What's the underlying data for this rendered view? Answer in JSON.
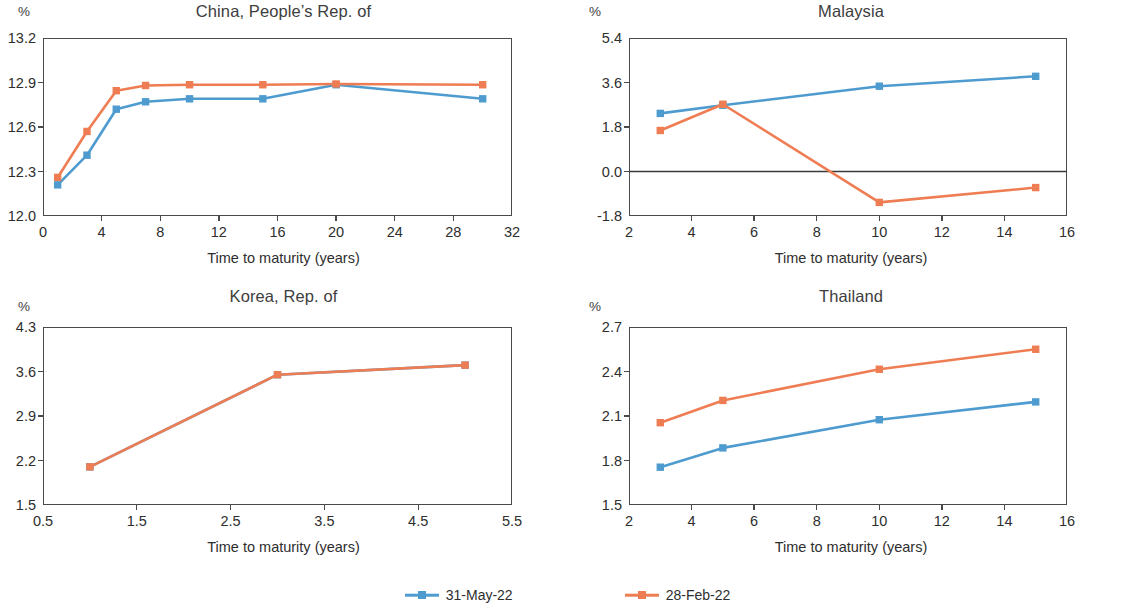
{
  "figure": {
    "axis_label": "Time to maturity  (years)",
    "percent_unit": "%"
  },
  "legend": {
    "position": "bottom-center",
    "items": [
      {
        "label": "31-May-22",
        "color": "#4E9BD0",
        "marker": "square"
      },
      {
        "label": "28-Feb-22",
        "color": "#EF7D53",
        "marker": "square"
      }
    ]
  },
  "chart_data": [
    {
      "type": "line",
      "title": "China, People’s Rep. of",
      "xlabel": "Time to maturity  (years)",
      "ylabel": "%",
      "xlim": [
        0,
        32
      ],
      "ylim": [
        12.0,
        13.2
      ],
      "xticks": [
        0,
        4,
        8,
        12,
        16,
        20,
        24,
        28,
        32
      ],
      "xticklabels": [
        "0",
        "4",
        "8",
        "12",
        "16",
        "20",
        "24",
        "28",
        "32"
      ],
      "yticks": [
        12.0,
        12.3,
        12.6,
        12.9,
        13.2
      ],
      "yticklabels": [
        "12.0",
        "12.3",
        "12.6",
        "12.9",
        "13.2"
      ],
      "grid": false,
      "zeroline": false,
      "x": [
        1,
        3,
        5,
        7,
        10,
        15,
        20,
        30
      ],
      "series": [
        {
          "name": "31-May-22",
          "color": "#4E9BD0",
          "values": [
            12.21,
            12.41,
            12.72,
            12.77,
            12.79,
            12.79,
            12.885,
            12.79
          ]
        },
        {
          "name": "28-Feb-22",
          "color": "#EF7D53",
          "values": [
            12.26,
            12.57,
            12.845,
            12.88,
            12.885,
            12.885,
            12.89,
            12.885
          ]
        }
      ]
    },
    {
      "type": "line",
      "title": "Malaysia",
      "xlabel": "Time to maturity  (years)",
      "ylabel": "%",
      "xlim": [
        2,
        16
      ],
      "ylim": [
        -1.8,
        5.4
      ],
      "xticks": [
        2,
        4,
        6,
        8,
        10,
        12,
        14,
        16
      ],
      "xticklabels": [
        "2",
        "4",
        "6",
        "8",
        "10",
        "12",
        "14",
        "16"
      ],
      "yticks": [
        -1.8,
        0.0,
        1.8,
        3.6,
        5.4
      ],
      "yticklabels": [
        "-1.8",
        "0.0",
        "1.8",
        "3.6",
        "5.4"
      ],
      "grid": false,
      "zeroline": true,
      "x": [
        3,
        5,
        10,
        15
      ],
      "series": [
        {
          "name": "31-May-22",
          "color": "#4E9BD0",
          "values": [
            2.35,
            2.68,
            3.45,
            3.85
          ]
        },
        {
          "name": "28-Feb-22",
          "color": "#EF7D53",
          "values": [
            1.66,
            2.72,
            -1.25,
            -0.65
          ]
        }
      ]
    },
    {
      "type": "line",
      "title": "Korea, Rep. of",
      "xlabel": "Time to maturity  (years)",
      "ylabel": "%",
      "xlim": [
        0.5,
        5.5
      ],
      "ylim": [
        1.5,
        4.3
      ],
      "xticks": [
        0.5,
        1.5,
        2.5,
        3.5,
        4.5,
        5.5
      ],
      "xticklabels": [
        "0.5",
        "1.5",
        "2.5",
        "3.5",
        "4.5",
        "5.5"
      ],
      "yticks": [
        1.5,
        2.2,
        2.9,
        3.6,
        4.3
      ],
      "yticklabels": [
        "1.5",
        "2.2",
        "2.9",
        "3.6",
        "4.3"
      ],
      "grid": false,
      "zeroline": false,
      "x": [
        1,
        3,
        5
      ],
      "series": [
        {
          "name": "31-May-22",
          "color": "#4E9BD0",
          "values": [
            2.1,
            3.55,
            3.7
          ]
        },
        {
          "name": "28-Feb-22",
          "color": "#EF7D53",
          "values": [
            2.1,
            3.55,
            3.7
          ]
        }
      ]
    },
    {
      "type": "line",
      "title": "Thailand",
      "xlabel": "Time to maturity  (years)",
      "ylabel": "%",
      "xlim": [
        2,
        16
      ],
      "ylim": [
        1.5,
        2.7
      ],
      "xticks": [
        2,
        4,
        6,
        8,
        10,
        12,
        14,
        16
      ],
      "xticklabels": [
        "2",
        "4",
        "6",
        "8",
        "10",
        "12",
        "14",
        "16"
      ],
      "yticks": [
        1.5,
        1.8,
        2.1,
        2.4,
        2.7
      ],
      "yticklabels": [
        "1.5",
        "1.8",
        "2.1",
        "2.4",
        "2.7"
      ],
      "grid": false,
      "zeroline": false,
      "x": [
        3,
        5,
        10,
        15
      ],
      "series": [
        {
          "name": "31-May-22",
          "color": "#4E9BD0",
          "values": [
            1.755,
            1.885,
            2.075,
            2.195
          ]
        },
        {
          "name": "28-Feb-22",
          "color": "#EF7D53",
          "values": [
            2.055,
            2.205,
            2.415,
            2.55
          ]
        }
      ]
    }
  ]
}
